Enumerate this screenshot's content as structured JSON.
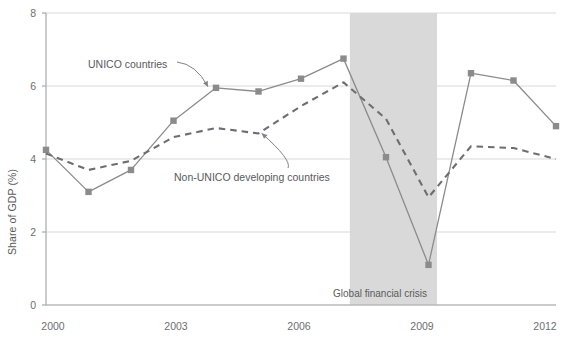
{
  "chart_data": {
    "type": "line",
    "title": "",
    "xlabel": "",
    "ylabel": "Share of GDP (%)",
    "xlim": [
      2000,
      2012
    ],
    "ylim": [
      0,
      8
    ],
    "yticks": [
      0,
      2,
      4,
      6,
      8
    ],
    "xticks": [
      2000,
      2003,
      2006,
      2009,
      2012
    ],
    "xtick_labels": [
      "2000",
      "2003",
      "2006",
      "2009",
      "2012"
    ],
    "ytick_labels": [
      "0",
      "2",
      "4",
      "6",
      "8"
    ],
    "grid": "horizontal",
    "legend_position": "inline-annotations",
    "x": [
      2000,
      2001,
      2002,
      2003,
      2004,
      2005,
      2006,
      2007,
      2008,
      2009,
      2010,
      2011,
      2012
    ],
    "series": [
      {
        "name": "UNICO countries",
        "style": "solid-with-square-markers",
        "color": "#8b8b8b",
        "values": [
          4.25,
          3.1,
          3.7,
          5.05,
          5.95,
          5.85,
          6.2,
          6.75,
          4.05,
          1.1,
          6.35,
          6.15,
          4.9
        ]
      },
      {
        "name": "Non-UNICO developing countries",
        "style": "dashed",
        "color": "#6d6e71",
        "values": [
          4.15,
          3.7,
          3.95,
          4.6,
          4.85,
          4.7,
          5.45,
          6.1,
          5.1,
          2.95,
          4.35,
          4.3,
          4.0
        ]
      }
    ],
    "shaded_regions": [
      {
        "label": "Global financial crisis",
        "x_start": 2007.15,
        "x_end": 2009.2,
        "color": "#d9d9d9"
      }
    ],
    "annotations": [
      {
        "text": "UNICO countries",
        "target_x": 2004,
        "target_y": 5.95
      },
      {
        "text": "Non-UNICO developing countries",
        "target_x": 2005,
        "target_y": 4.7
      }
    ]
  },
  "colors": {
    "series_unico": "#8b8b8b",
    "series_non_unico": "#6d6e71",
    "gridline": "#d8d9da",
    "axis": "#a7a9ac",
    "shade": "#d9d9d9",
    "text": "#58595b"
  }
}
